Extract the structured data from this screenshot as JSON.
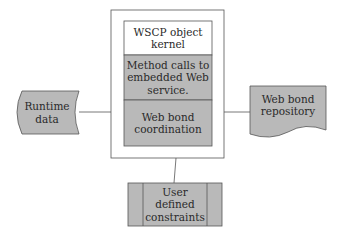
{
  "diagram": {
    "central_component": {
      "sections": [
        {
          "label": "WSCP object kernel",
          "lines": [
            "WSCP object",
            "kernel"
          ],
          "fill": "#ffffff"
        },
        {
          "label": "Method calls to embedded Web service.",
          "lines": [
            "Method calls to",
            "embedded Web",
            "service."
          ],
          "fill": "#b9b9b9"
        },
        {
          "label": "Web bond coordination",
          "lines": [
            "Web bond",
            "coordination"
          ],
          "fill": "#b9b9b9"
        }
      ]
    },
    "left_node": {
      "label": "Runtime data",
      "lines": [
        "Runtime",
        "data"
      ],
      "shape": "stored-data",
      "fill": "#b9b9b9"
    },
    "right_node": {
      "label": "Web bond repository",
      "lines": [
        "Web bond",
        "repository"
      ],
      "shape": "document",
      "fill": "#b9b9b9"
    },
    "bottom_node": {
      "label": "User defined constraints",
      "lines": [
        "User defined",
        "constraints"
      ],
      "shape": "predefined-process",
      "fill": "#b9b9b9"
    },
    "connections": [
      {
        "from": "Runtime data",
        "to": "central_component"
      },
      {
        "from": "central_component",
        "to": "Web bond repository"
      },
      {
        "from": "central_component",
        "to": "User defined constraints"
      }
    ],
    "colors": {
      "stroke": "#555555",
      "fill": "#b9b9b9",
      "background": "#ffffff"
    }
  }
}
